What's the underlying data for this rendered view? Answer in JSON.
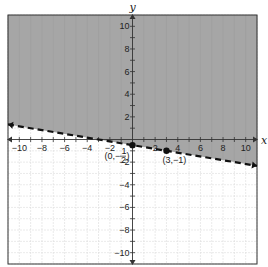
{
  "chart_data": {
    "type": "line",
    "title": "",
    "xlabel": "x",
    "ylabel": "y",
    "xlim": [
      -11,
      11
    ],
    "ylim": [
      -11,
      11
    ],
    "grid": true,
    "x_ticks": [
      -10,
      -8,
      -6,
      -4,
      -2,
      2,
      4,
      6,
      8,
      10
    ],
    "y_ticks": [
      10,
      8,
      6,
      4,
      2,
      -2,
      -4,
      -6,
      -8,
      -10
    ],
    "boundary_line": {
      "equation": "y = -1/6 x - 1/2",
      "style": "dashed",
      "slope": -0.1667,
      "intercept": -0.5,
      "endpoints": [
        [
          -11,
          1.33
        ],
        [
          11,
          -2.33
        ]
      ]
    },
    "shaded_region": "above line",
    "shade_color": "#a6a6a6",
    "points": [
      {
        "x": 0,
        "y": -0.5,
        "label_prefix": "(0,−",
        "label_num": "1",
        "label_den": "2",
        "label_suffix": ")"
      },
      {
        "x": 3,
        "y": -1,
        "label": "(3,−1)"
      }
    ]
  }
}
